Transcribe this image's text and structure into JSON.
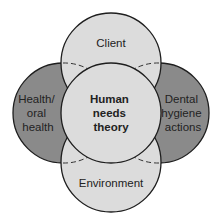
{
  "diagram": {
    "type": "overlapping-circles",
    "center": {
      "label_lines": [
        "Human",
        "needs",
        "theory"
      ]
    },
    "top": {
      "label_lines": [
        "Client"
      ]
    },
    "bottom": {
      "label_lines": [
        "Environment"
      ]
    },
    "left": {
      "label_lines": [
        "Health/",
        "oral",
        "health"
      ]
    },
    "right": {
      "label_lines": [
        "Dental",
        "hygiene",
        "actions"
      ]
    },
    "colors": {
      "light_fill": "#dcdcdc",
      "dark_fill": "#8a8a8a",
      "stroke": "#1e1e1e"
    }
  }
}
